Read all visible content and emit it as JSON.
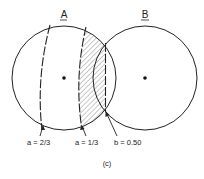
{
  "figure": {
    "caption": "(c)",
    "circles": [
      {
        "label": "A",
        "cx": 64,
        "cy": 78,
        "r": 52
      },
      {
        "label": "B",
        "cx": 145,
        "cy": 78,
        "r": 52
      }
    ],
    "annotations": [
      {
        "id": "a23",
        "text": "a = 2/3"
      },
      {
        "id": "a13",
        "text": "a = 1/3"
      },
      {
        "id": "b050",
        "text": "b = 0.50"
      }
    ],
    "colors": {
      "stroke": "#222222",
      "hatch": "#555555",
      "background": "#ffffff"
    }
  }
}
